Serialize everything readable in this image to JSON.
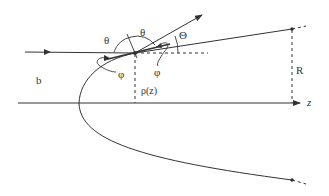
{
  "diagram": {
    "labels": {
      "theta_left": "θ",
      "theta_right": "θ",
      "big_theta": "Θ",
      "phi_left": "φ",
      "phi_right": "φ",
      "impact_parameter": "b",
      "rho": "ρ(z)",
      "radius": "R",
      "z_axis": "z"
    },
    "colors": {
      "line": "#333333",
      "background": "#ffffff"
    }
  }
}
